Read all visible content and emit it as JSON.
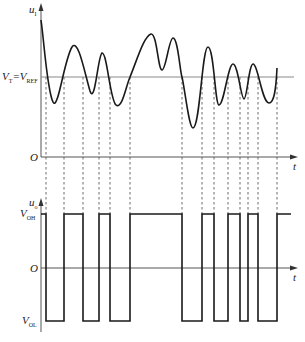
{
  "diagram": {
    "type": "comparator-waveforms",
    "upper_plot": {
      "y_axis_label": "u",
      "y_axis_sub": "I",
      "x_axis_label": "t",
      "origin_label": "O",
      "threshold_label_main": "V",
      "threshold_label_sub1": "T",
      "threshold_label_eq": "=V",
      "threshold_label_sub2": "REF"
    },
    "lower_plot": {
      "y_axis_label": "u",
      "y_axis_sub": "o",
      "x_axis_label": "t",
      "origin_label": "O",
      "high_label": "V",
      "high_sub": "OH",
      "low_label": "V",
      "low_sub": "OL"
    },
    "crossing_x": [
      46,
      64,
      83,
      99,
      110,
      130,
      182,
      202,
      214,
      228,
      240,
      248,
      258,
      277
    ],
    "colors": {
      "line": "#1a1a1a",
      "axis": "#555555",
      "threshold": "#888888",
      "dash": "#444444"
    }
  }
}
